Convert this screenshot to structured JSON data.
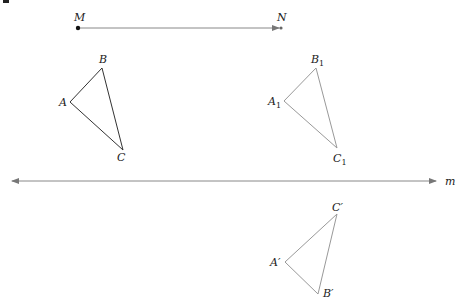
{
  "diagram": {
    "vector": {
      "start_label": "M",
      "end_label": "N",
      "start": [
        78,
        28
      ],
      "end": [
        281,
        28
      ]
    },
    "line_m": {
      "label": "m",
      "x1": 10,
      "x2": 438,
      "y": 181
    },
    "triangles": [
      {
        "name": "original",
        "color": "#333333",
        "vertices": [
          {
            "label": "A",
            "sub": "",
            "prime": "",
            "x": 70,
            "y": 102
          },
          {
            "label": "B",
            "sub": "",
            "prime": "",
            "x": 102,
            "y": 68
          },
          {
            "label": "C",
            "sub": "",
            "prime": "",
            "x": 123,
            "y": 150
          }
        ]
      },
      {
        "name": "translated",
        "color": "#999999",
        "vertices": [
          {
            "label": "A",
            "sub": "1",
            "prime": "",
            "x": 284,
            "y": 101
          },
          {
            "label": "B",
            "sub": "1",
            "prime": "",
            "x": 316,
            "y": 68
          },
          {
            "label": "C",
            "sub": "1",
            "prime": "",
            "x": 337,
            "y": 148
          }
        ]
      },
      {
        "name": "reflected",
        "color": "#999999",
        "vertices": [
          {
            "label": "A",
            "sub": "",
            "prime": "′",
            "x": 285,
            "y": 262
          },
          {
            "label": "B",
            "sub": "",
            "prime": "′",
            "x": 318,
            "y": 294
          },
          {
            "label": "C",
            "sub": "",
            "prime": "′",
            "x": 337,
            "y": 214
          }
        ]
      }
    ],
    "labels": {
      "M": "M",
      "N": "N",
      "m": "m",
      "A": "A",
      "B": "B",
      "C": "C",
      "A1": "A",
      "B1": "B",
      "C1": "C",
      "one": "1",
      "Ap": "A′",
      "Bp": "B′",
      "Cp": "C′"
    }
  }
}
